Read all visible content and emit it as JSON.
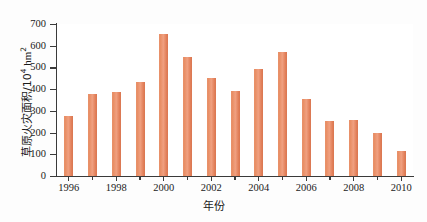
{
  "chart_data": {
    "type": "bar",
    "title": "",
    "xlabel": "年份",
    "ylabel_prefix": "草原火灾面积/10",
    "ylabel_exponent": "4",
    "ylabel_unit": " hm",
    "ylabel_unit_exponent": "2",
    "ylabel_full": "草原火灾面积/10⁴ hm²",
    "categories": [
      1996,
      1997,
      1998,
      1999,
      2000,
      2001,
      2002,
      2003,
      2004,
      2005,
      2006,
      2007,
      2008,
      2009,
      2010
    ],
    "values": [
      277,
      378,
      385,
      432,
      655,
      548,
      450,
      390,
      492,
      572,
      353,
      253,
      256,
      197,
      115
    ],
    "ylim": [
      0,
      700
    ],
    "ytick_labels": [
      "700",
      "600",
      "500",
      "400",
      "300",
      "200",
      "100",
      "0"
    ],
    "ytick_values": [
      700,
      600,
      500,
      400,
      300,
      200,
      100,
      0
    ],
    "xtick_labels": [
      "1996",
      "1998",
      "2000",
      "2002",
      "2004",
      "2006",
      "2008",
      "2010"
    ],
    "xtick_values": [
      1996,
      1998,
      2000,
      2002,
      2004,
      2006,
      2008,
      2010
    ],
    "grid": false,
    "legend": null,
    "bar_color": "#e88b62",
    "axis_color": "#3a3a3a",
    "background": "#ffffff"
  }
}
